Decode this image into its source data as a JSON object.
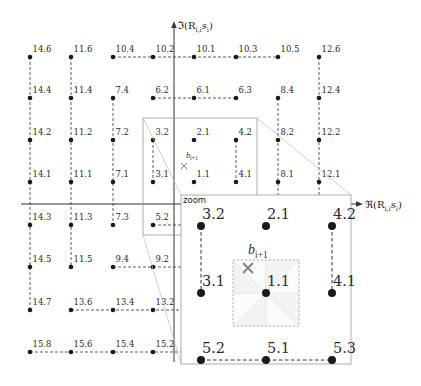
{
  "figure": {
    "axes": {
      "imag": {
        "symbol": "ℑ(R",
        "sub_a": "i,i",
        "mid": "s",
        "sub_b": "i",
        "close": ")"
      },
      "real": {
        "symbol": "ℜ(R",
        "sub_a": "i,i",
        "mid": "s",
        "sub_b": "i",
        "close": ")"
      }
    },
    "lattice_points": [
      {
        "label": "14.6",
        "col": 0,
        "row": 0
      },
      {
        "label": "11.6",
        "col": 1,
        "row": 0
      },
      {
        "label": "10.4",
        "col": 2,
        "row": 0
      },
      {
        "label": "10.2",
        "col": 3,
        "row": 0
      },
      {
        "label": "10.1",
        "col": 4,
        "row": 0
      },
      {
        "label": "10.3",
        "col": 5,
        "row": 0
      },
      {
        "label": "10.5",
        "col": 6,
        "row": 0
      },
      {
        "label": "12.6",
        "col": 7,
        "row": 0
      },
      {
        "label": "14.4",
        "col": 0,
        "row": 1
      },
      {
        "label": "11.4",
        "col": 1,
        "row": 1
      },
      {
        "label": "7.4",
        "col": 2,
        "row": 1
      },
      {
        "label": "6.2",
        "col": 3,
        "row": 1
      },
      {
        "label": "6.1",
        "col": 4,
        "row": 1
      },
      {
        "label": "6.3",
        "col": 5,
        "row": 1
      },
      {
        "label": "8.4",
        "col": 6,
        "row": 1
      },
      {
        "label": "12.4",
        "col": 7,
        "row": 1
      },
      {
        "label": "14.2",
        "col": 0,
        "row": 2
      },
      {
        "label": "11.2",
        "col": 1,
        "row": 2
      },
      {
        "label": "7.2",
        "col": 2,
        "row": 2
      },
      {
        "label": "3.2",
        "col": 3,
        "row": 2
      },
      {
        "label": "2.1",
        "col": 4,
        "row": 2
      },
      {
        "label": "4.2",
        "col": 5,
        "row": 2
      },
      {
        "label": "8.2",
        "col": 6,
        "row": 2
      },
      {
        "label": "12.2",
        "col": 7,
        "row": 2
      },
      {
        "label": "14.1",
        "col": 0,
        "row": 3
      },
      {
        "label": "11.1",
        "col": 1,
        "row": 3
      },
      {
        "label": "7.1",
        "col": 2,
        "row": 3
      },
      {
        "label": "3.1",
        "col": 3,
        "row": 3
      },
      {
        "label": "1.1",
        "col": 4,
        "row": 3
      },
      {
        "label": "4.1",
        "col": 5,
        "row": 3
      },
      {
        "label": "8.1",
        "col": 6,
        "row": 3
      },
      {
        "label": "12.1",
        "col": 7,
        "row": 3
      },
      {
        "label": "14.3",
        "col": 0,
        "row": 4
      },
      {
        "label": "11.3",
        "col": 1,
        "row": 4
      },
      {
        "label": "7.3",
        "col": 2,
        "row": 4
      },
      {
        "label": "5.2",
        "col": 3,
        "row": 4
      },
      {
        "label": "14.5",
        "col": 0,
        "row": 5
      },
      {
        "label": "11.5",
        "col": 1,
        "row": 5
      },
      {
        "label": "9.4",
        "col": 2,
        "row": 5
      },
      {
        "label": "9.2",
        "col": 3,
        "row": 5
      },
      {
        "label": "14.7",
        "col": 0,
        "row": 6
      },
      {
        "label": "13.6",
        "col": 1,
        "row": 6
      },
      {
        "label": "13.4",
        "col": 2,
        "row": 6
      },
      {
        "label": "13.2",
        "col": 3,
        "row": 6
      },
      {
        "label": "15.8",
        "col": 0,
        "row": 7
      },
      {
        "label": "15.6",
        "col": 1,
        "row": 7
      },
      {
        "label": "15.4",
        "col": 2,
        "row": 7
      },
      {
        "label": "15.2",
        "col": 3,
        "row": 7
      }
    ],
    "dashed_paths": [
      [
        [
          2,
          0
        ],
        [
          6,
          0
        ]
      ],
      [
        [
          3,
          1
        ],
        [
          5,
          1
        ]
      ],
      [
        [
          3,
          4
        ],
        [
          5,
          4
        ]
      ],
      [
        [
          2,
          5
        ],
        [
          4,
          5
        ]
      ],
      [
        [
          1,
          6
        ],
        [
          4,
          6
        ]
      ],
      [
        [
          0,
          7
        ],
        [
          4,
          7
        ]
      ],
      [
        [
          0,
          0
        ],
        [
          0,
          6
        ]
      ],
      [
        [
          1,
          0
        ],
        [
          1,
          5
        ]
      ],
      [
        [
          2,
          1
        ],
        [
          2,
          4
        ]
      ],
      [
        [
          3,
          2
        ],
        [
          3,
          3
        ]
      ],
      [
        [
          5,
          2
        ],
        [
          5,
          3
        ]
      ],
      [
        [
          6,
          1
        ],
        [
          6,
          4
        ]
      ],
      [
        [
          7,
          0
        ],
        [
          7,
          4
        ]
      ]
    ],
    "estimate": {
      "symbol": "b",
      "sub": "i+1",
      "marker": "cross"
    },
    "zoom_inset": {
      "title": "zoom",
      "points": [
        {
          "label": "3.2",
          "col": 0,
          "row": 0
        },
        {
          "label": "2.1",
          "col": 1,
          "row": 0
        },
        {
          "label": "4.2",
          "col": 2,
          "row": 0
        },
        {
          "label": "3.1",
          "col": 0,
          "row": 1
        },
        {
          "label": "1.1",
          "col": 1,
          "row": 1
        },
        {
          "label": "4.1",
          "col": 2,
          "row": 1
        },
        {
          "label": "5.2",
          "col": 0,
          "row": 2
        },
        {
          "label": "5.1",
          "col": 1,
          "row": 2
        },
        {
          "label": "5.3",
          "col": 2,
          "row": 2
        }
      ],
      "dashed_paths": [
        [
          [
            0,
            0
          ],
          [
            0,
            1
          ]
        ],
        [
          [
            2,
            0
          ],
          [
            2,
            1
          ]
        ],
        [
          [
            0,
            2
          ],
          [
            2,
            2
          ]
        ]
      ],
      "decision_region_center": "1.1"
    },
    "colors": {
      "point": "#1a1a1a",
      "dash": "#333333",
      "axis": "#333333",
      "estimate_marker": "#888888",
      "inset_border": "#999999",
      "connector": "#bbbbbb",
      "region_border": "#aaaaaa"
    }
  }
}
